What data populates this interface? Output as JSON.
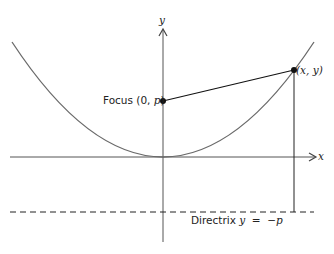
{
  "diagram": {
    "axes": {
      "x_label": "x",
      "y_label": "y"
    },
    "focus": {
      "label_prefix": "Focus (0, ",
      "label_var": "p",
      "label_suffix": ")"
    },
    "point": {
      "label": "(x, y)"
    },
    "directrix": {
      "label_prefix": "Directrix ",
      "label_eq": "y  =  −p"
    },
    "colors": {
      "curve": "#6a6a6a",
      "axes": "#555555",
      "ink": "#111111"
    }
  }
}
